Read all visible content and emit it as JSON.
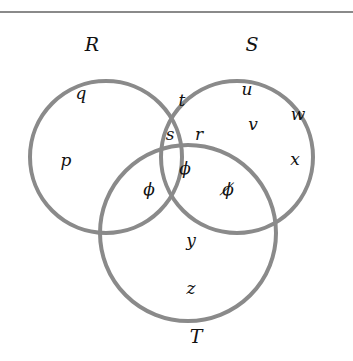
{
  "diagram": {
    "type": "venn",
    "stroke_color": "#8a8a8a",
    "sets": [
      {
        "name": "R",
        "cx": 106,
        "cy": 157,
        "r": 76,
        "label_x": 92,
        "label_y": 51
      },
      {
        "name": "S",
        "cx": 237,
        "cy": 157,
        "r": 76,
        "label_x": 252,
        "label_y": 51
      },
      {
        "name": "T",
        "cx": 188,
        "cy": 233,
        "r": 88,
        "label_x": 196,
        "label_y": 343
      }
    ],
    "elements": [
      {
        "text": "q",
        "region": "R only",
        "x": 81,
        "y": 99
      },
      {
        "text": "p",
        "region": "R only",
        "x": 66,
        "y": 166
      },
      {
        "text": "t",
        "region": "R ∩ S only",
        "x": 182,
        "y": 106
      },
      {
        "text": "s",
        "region": "R ∩ S only",
        "x": 170,
        "y": 140
      },
      {
        "text": "r",
        "region": "R ∩ S only",
        "x": 199,
        "y": 140
      },
      {
        "text": "u",
        "region": "S only",
        "x": 247,
        "y": 95
      },
      {
        "text": "v",
        "region": "S only",
        "x": 253,
        "y": 130
      },
      {
        "text": "w",
        "region": "S only",
        "x": 298,
        "y": 120
      },
      {
        "text": "x",
        "region": "S only",
        "x": 295,
        "y": 165
      },
      {
        "text": "ϕ",
        "region": "R ∩ S ∩ T",
        "x": 185,
        "y": 174
      },
      {
        "text": "ϕ",
        "region": "R ∩ T only",
        "x": 149,
        "y": 195
      },
      {
        "text": "ϕ̸",
        "region": "S ∩ T only",
        "x": 228,
        "y": 195
      },
      {
        "text": "y",
        "region": "T only",
        "x": 191,
        "y": 246
      },
      {
        "text": "z",
        "region": "T only",
        "x": 191,
        "y": 294
      }
    ]
  }
}
